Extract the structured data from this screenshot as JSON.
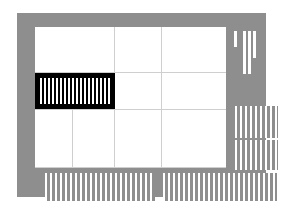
{
  "artboard": {
    "title": "Design layout board",
    "board_color": "#8e8e8e",
    "field_color": "#ffffff",
    "panel_color": "#000000",
    "slat_color": "#ffffff",
    "grid_color": "#cfcfcf"
  },
  "caption": {
    "line1": "セッケイをたのむ",
    "line2": "デザイナーズマンション"
  },
  "grid": {
    "vertical_lines": [
      {
        "x": 97,
        "y": 14,
        "h": 141
      },
      {
        "x": 144,
        "y": 14,
        "h": 141
      },
      {
        "x": 55,
        "y": 96,
        "h": 59
      }
    ],
    "horizontal_lines": [
      {
        "x": 18,
        "y": 59,
        "w": 191
      },
      {
        "x": 18,
        "y": 96,
        "w": 191
      },
      {
        "x": 18,
        "y": 154,
        "w": 191
      }
    ]
  },
  "black_panel": {
    "label": "louvre-module",
    "x": 18,
    "y": 60,
    "w": 80,
    "h": 36
  },
  "slat_blocks": [
    {
      "name": "right-upper-slat-block",
      "x": 218,
      "y": 93,
      "w": 43,
      "h": 32
    },
    {
      "name": "right-lower-slat-block",
      "x": 218,
      "y": 127,
      "w": 43,
      "h": 30
    },
    {
      "name": "bottom-left-slat-block",
      "x": 28,
      "y": 160,
      "w": 110,
      "h": 28
    },
    {
      "name": "bottom-right-slat-block",
      "x": 146,
      "y": 160,
      "w": 114,
      "h": 28
    }
  ],
  "bars": [
    {
      "name": "bar-short",
      "x": 217,
      "y": 18,
      "w": 3,
      "h": 16
    },
    {
      "name": "bar-tall-1",
      "x": 226,
      "y": 18,
      "w": 3,
      "h": 43
    },
    {
      "name": "bar-tall-2",
      "x": 231,
      "y": 18,
      "w": 3,
      "h": 43
    },
    {
      "name": "bar-tall-3",
      "x": 236,
      "y": 18,
      "w": 3,
      "h": 27
    }
  ]
}
